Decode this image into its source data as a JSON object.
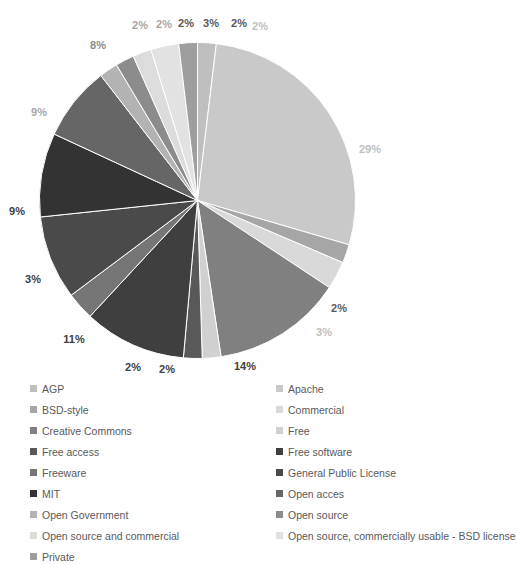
{
  "chart_data": {
    "type": "pie",
    "title": "",
    "start_angle_deg": -90,
    "direction": "clockwise",
    "legend_position": "bottom",
    "grid": false,
    "categories": [
      "AGP",
      "Apache",
      "BSD-style",
      "Commercial",
      "Creative Commons",
      "Free",
      "Free access",
      "Free software",
      "Freeware",
      "General Public License",
      "MIT",
      "Open acces",
      "Open Government",
      "Open source",
      "Open source and commercial",
      "Open source, commercially usable - BSD license",
      "Private"
    ],
    "values": [
      2,
      29,
      2,
      3,
      14,
      2,
      2,
      11,
      3,
      9,
      9,
      8,
      2,
      2,
      2,
      3,
      2
    ],
    "colors": [
      "#bfbfbf",
      "#c9c9c9",
      "#a6a6a6",
      "#d9d9d9",
      "#808080",
      "#d0d0d0",
      "#595959",
      "#3f3f3f",
      "#767676",
      "#4a4a4a",
      "#333333",
      "#666666",
      "#b3b3b3",
      "#8c8c8c",
      "#dcdcdc",
      "#e2e2e2",
      "#9e9e9e"
    ],
    "slices": [
      {
        "label": "2%",
        "value": 2,
        "color": "#bfbfbf",
        "name": "AGP"
      },
      {
        "label": "29%",
        "value": 29,
        "color": "#c9c9c9",
        "name": "Apache"
      },
      {
        "label": "2%",
        "value": 2,
        "color": "#a6a6a6",
        "name": "BSD-style"
      },
      {
        "label": "3%",
        "value": 3,
        "color": "#d9d9d9",
        "name": "Commercial"
      },
      {
        "label": "14%",
        "value": 14,
        "color": "#808080",
        "name": "Creative Commons"
      },
      {
        "label": "2%",
        "value": 2,
        "color": "#d0d0d0",
        "name": "Free"
      },
      {
        "label": "2%",
        "value": 2,
        "color": "#595959",
        "name": "Free access"
      },
      {
        "label": "11%",
        "value": 11,
        "color": "#3f3f3f",
        "name": "Free software"
      },
      {
        "label": "3%",
        "value": 3,
        "color": "#767676",
        "name": "Freeware"
      },
      {
        "label": "9%",
        "value": 9,
        "color": "#4a4a4a",
        "name": "General Public License"
      },
      {
        "label": "9%",
        "value": 9,
        "color": "#333333",
        "name": "MIT"
      },
      {
        "label": "8%",
        "value": 8,
        "color": "#666666",
        "name": "Open acces"
      },
      {
        "label": "2%",
        "value": 2,
        "color": "#b3b3b3",
        "name": "Open Government"
      },
      {
        "label": "2%",
        "value": 2,
        "color": "#8c8c8c",
        "name": "Open source"
      },
      {
        "label": "2%",
        "value": 2,
        "color": "#dcdcdc",
        "name": "Open source and commercial"
      },
      {
        "label": "3%",
        "value": 3,
        "color": "#e2e2e2",
        "name": "Open source, commercially usable - BSD license"
      },
      {
        "label": "2%",
        "value": 2,
        "color": "#9e9e9e",
        "name": "Private"
      }
    ],
    "data_labels": [
      {
        "text": "2%",
        "x": 140,
        "y": 25,
        "color": "#a6a6a6"
      },
      {
        "text": "2%",
        "x": 164,
        "y": 24,
        "color": "#a6a6a6"
      },
      {
        "text": "2%",
        "x": 186,
        "y": 23,
        "color": "#595959"
      },
      {
        "text": "3%",
        "x": 211,
        "y": 23,
        "color": "#595959"
      },
      {
        "text": "2%",
        "x": 239,
        "y": 23,
        "color": "#595959"
      },
      {
        "text": "2%",
        "x": 260,
        "y": 26,
        "color": "#bfbfbf"
      },
      {
        "text": "29%",
        "x": 370,
        "y": 149,
        "color": "#bfbfbf"
      },
      {
        "text": "2%",
        "x": 339,
        "y": 308,
        "color": "#595959"
      },
      {
        "text": "3%",
        "x": 324,
        "y": 332,
        "color": "#bfbfbf"
      },
      {
        "text": "14%",
        "x": 245,
        "y": 366,
        "color": "#404040"
      },
      {
        "text": "2%",
        "x": 167,
        "y": 369,
        "color": "#404040"
      },
      {
        "text": "2%",
        "x": 133,
        "y": 367,
        "color": "#404040"
      },
      {
        "text": "11%",
        "x": 74,
        "y": 339,
        "color": "#404040"
      },
      {
        "text": "3%",
        "x": 33,
        "y": 279,
        "color": "#404040"
      },
      {
        "text": "9%",
        "x": 17,
        "y": 211,
        "color": "#404040"
      },
      {
        "text": "9%",
        "x": 39,
        "y": 112,
        "color": "#a6a6a6"
      },
      {
        "text": "8%",
        "x": 98,
        "y": 45,
        "color": "#8c8c8c"
      }
    ]
  },
  "legend": {
    "items": [
      {
        "label": "AGP",
        "color": "#bfbfbf"
      },
      {
        "label": "Apache",
        "color": "#c9c9c9"
      },
      {
        "label": "BSD-style",
        "color": "#a6a6a6"
      },
      {
        "label": "Commercial",
        "color": "#d9d9d9"
      },
      {
        "label": "Creative Commons",
        "color": "#808080"
      },
      {
        "label": "Free",
        "color": "#d0d0d0"
      },
      {
        "label": "Free access",
        "color": "#595959"
      },
      {
        "label": "Free software",
        "color": "#3f3f3f"
      },
      {
        "label": "Freeware",
        "color": "#767676"
      },
      {
        "label": "General Public License",
        "color": "#4a4a4a"
      },
      {
        "label": "MIT",
        "color": "#333333"
      },
      {
        "label": "Open acces",
        "color": "#666666"
      },
      {
        "label": "Open Government",
        "color": "#b3b3b3"
      },
      {
        "label": "Open source",
        "color": "#8c8c8c"
      },
      {
        "label": "Open source and commercial",
        "color": "#dcdcdc"
      },
      {
        "label": "Open source, commercially usable - BSD license",
        "color": "#e2e2e2"
      },
      {
        "label": "Private",
        "color": "#9e9e9e"
      }
    ]
  }
}
